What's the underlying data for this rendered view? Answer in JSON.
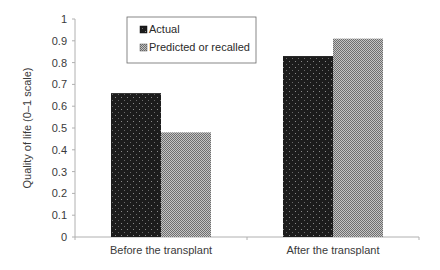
{
  "chart_data": {
    "type": "bar",
    "title": "",
    "xlabel": "",
    "ylabel": "Quality of life (0–1 scale)",
    "ylim": [
      0,
      1
    ],
    "yticks": [
      0,
      0.1,
      0.2,
      0.3,
      0.4,
      0.5,
      0.6,
      0.7,
      0.8,
      0.9,
      1
    ],
    "ytick_labels": [
      "0",
      "0.1",
      "0.2",
      "0.3",
      "0.4",
      "0.5",
      "0.6",
      "0.7",
      "0.8",
      "0.9",
      "1"
    ],
    "grid": false,
    "legend_position": "upper-left inside",
    "categories": [
      "Before the transplant",
      "After the transplant"
    ],
    "series": [
      {
        "name": "Actual",
        "values": [
          0.66,
          0.83
        ],
        "color": "#1e1e1e",
        "pattern": "dotted-dark"
      },
      {
        "name": "Predicted or recalled",
        "values": [
          0.48,
          0.91
        ],
        "color": "#9a9a9a",
        "pattern": "checker-gray"
      }
    ]
  },
  "legend": {
    "items": [
      {
        "label": "Actual"
      },
      {
        "label": "Predicted or recalled"
      }
    ]
  }
}
